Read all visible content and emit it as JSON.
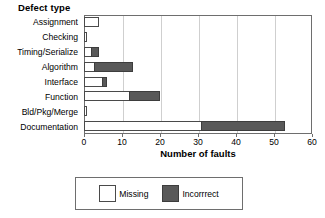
{
  "chart_data": {
    "type": "bar",
    "orientation": "horizontal",
    "stacked": true,
    "title": "Defect type",
    "xlabel": "Number of faults",
    "ylabel": "Defect type",
    "xlim": [
      0,
      60
    ],
    "xticks": [
      0,
      10,
      20,
      30,
      40,
      50,
      60
    ],
    "grid": true,
    "grid_axis": "x",
    "legend_position": "bottom",
    "categories": [
      "Assignment",
      "Checking",
      "Timing/Serialize",
      "Algorithm",
      "Interface",
      "Function",
      "Bld/Pkg/Merge",
      "Documentation"
    ],
    "series": [
      {
        "name": "Missing",
        "color": "#ffffff",
        "values": [
          4,
          0.5,
          2,
          3,
          5,
          12,
          0.5,
          31
        ]
      },
      {
        "name": "Incorrrect",
        "color": "#595959",
        "values": [
          0,
          0,
          2,
          10,
          1,
          8,
          0,
          22
        ]
      }
    ],
    "totals": [
      4,
      0.5,
      4,
      13,
      6,
      20,
      0.5,
      53
    ]
  },
  "legend": {
    "items": [
      {
        "label": "Missing",
        "swatch": "white-square"
      },
      {
        "label": "Incorrrect",
        "swatch": "gray-square"
      }
    ]
  },
  "colors": {
    "missing_fill": "#ffffff",
    "incorrect_fill": "#595959",
    "axis_line": "#6e6e6e",
    "gridline": "#cfcfcf",
    "text": "#000000"
  }
}
